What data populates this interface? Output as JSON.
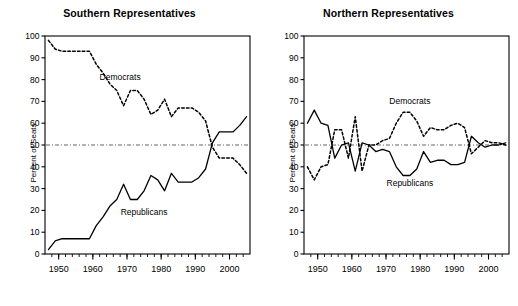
{
  "figure": {
    "panels": [
      {
        "id": "southern",
        "title": "Southern Representatives",
        "ylabel": "Percent of Seats"
      },
      {
        "id": "northern",
        "title": "Northern Representatives",
        "ylabel": "Percent of Seats"
      }
    ]
  },
  "chart_data": [
    {
      "type": "line",
      "title": "Southern Representatives",
      "xlabel": "",
      "ylabel": "Percent of Seats",
      "xlim": [
        1946,
        2006
      ],
      "ylim": [
        0,
        100
      ],
      "yticks": [
        0,
        10,
        20,
        30,
        40,
        50,
        60,
        70,
        80,
        90,
        100
      ],
      "xticks": [
        1950,
        1960,
        1970,
        1980,
        1990,
        2000
      ],
      "xminor_step": 2,
      "grid": false,
      "reference_line": {
        "y": 50,
        "style": "dash-dot",
        "label": ""
      },
      "legend": "inline-annotations",
      "series": [
        {
          "name": "Democrats",
          "style": "dashed",
          "x": [
            1947,
            1949,
            1951,
            1953,
            1955,
            1957,
            1959,
            1961,
            1963,
            1965,
            1967,
            1969,
            1971,
            1973,
            1975,
            1977,
            1979,
            1981,
            1983,
            1985,
            1987,
            1989,
            1991,
            1993,
            1995,
            1997,
            1999,
            2001,
            2003,
            2005
          ],
          "values": [
            98,
            94,
            93,
            93,
            93,
            93,
            93,
            87,
            83,
            78,
            75,
            68,
            75,
            75,
            71,
            64,
            66,
            71,
            63,
            67,
            67,
            67,
            65,
            61,
            49,
            44,
            44,
            44,
            41,
            37
          ]
        },
        {
          "name": "Republicans",
          "style": "solid",
          "x": [
            1947,
            1949,
            1951,
            1953,
            1955,
            1957,
            1959,
            1961,
            1963,
            1965,
            1967,
            1969,
            1971,
            1973,
            1975,
            1977,
            1979,
            1981,
            1983,
            1985,
            1987,
            1989,
            1991,
            1993,
            1995,
            1997,
            1999,
            2001,
            2003,
            2005
          ],
          "values": [
            2,
            6,
            7,
            7,
            7,
            7,
            7,
            13,
            17,
            22,
            25,
            32,
            25,
            25,
            29,
            36,
            34,
            29,
            37,
            33,
            33,
            33,
            35,
            39,
            51,
            56,
            56,
            56,
            59,
            63
          ]
        }
      ]
    },
    {
      "type": "line",
      "title": "Northern Representatives",
      "xlabel": "",
      "ylabel": "Percent of Seats",
      "xlim": [
        1946,
        2006
      ],
      "ylim": [
        0,
        100
      ],
      "yticks": [
        0,
        10,
        20,
        30,
        40,
        50,
        60,
        70,
        80,
        90,
        100
      ],
      "xticks": [
        1950,
        1960,
        1970,
        1980,
        1990,
        2000
      ],
      "xminor_step": 2,
      "grid": false,
      "reference_line": {
        "y": 50,
        "style": "dash-dot",
        "label": ""
      },
      "legend": "inline-annotations",
      "series": [
        {
          "name": "Democrats",
          "style": "dashed",
          "x": [
            1947,
            1949,
            1951,
            1953,
            1955,
            1957,
            1959,
            1961,
            1963,
            1965,
            1967,
            1969,
            1971,
            1973,
            1975,
            1977,
            1979,
            1981,
            1983,
            1985,
            1987,
            1989,
            1991,
            1993,
            1995,
            1997,
            1999,
            2001,
            2003,
            2005
          ],
          "values": [
            40,
            34,
            40,
            41,
            57,
            57,
            44,
            63,
            38,
            50,
            50,
            52,
            53,
            60,
            65,
            65,
            61,
            54,
            58,
            57,
            57,
            59,
            60,
            58,
            46,
            49,
            52,
            51,
            51,
            50
          ]
        },
        {
          "name": "Republicans",
          "style": "solid",
          "x": [
            1947,
            1949,
            1951,
            1953,
            1955,
            1957,
            1959,
            1961,
            1963,
            1965,
            1967,
            1969,
            1971,
            1973,
            1975,
            1977,
            1979,
            1981,
            1983,
            1985,
            1987,
            1989,
            1991,
            1993,
            1995,
            1997,
            1999,
            2001,
            2003,
            2005
          ],
          "values": [
            60,
            66,
            60,
            59,
            44,
            50,
            51,
            38,
            51,
            50,
            47,
            48,
            47,
            40,
            36,
            36,
            39,
            47,
            42,
            43,
            43,
            41,
            41,
            42,
            54,
            51,
            49,
            50,
            50,
            51
          ]
        }
      ]
    }
  ],
  "annotations": {
    "southern": {
      "democrats": "Democrats",
      "republicans": "Republicans"
    },
    "northern": {
      "democrats": "Democrats",
      "republicans": "Republicans"
    }
  },
  "colors": {
    "line": "#000000",
    "axis": "#000000",
    "reference": "#555555",
    "background": "#ffffff"
  }
}
